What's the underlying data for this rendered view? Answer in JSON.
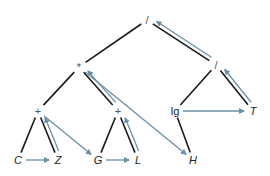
{
  "diagram": {
    "type": "expression-tree-traversal",
    "colors": {
      "edge": "#1a1a1a",
      "traversal": "#6b8fa3",
      "operator": "#555555",
      "leaf": "#222222"
    },
    "nodes": [
      {
        "id": "root",
        "label": "/",
        "x": 147,
        "y": 20,
        "italic": false,
        "op": true
      },
      {
        "id": "mul",
        "label": "*",
        "x": 79,
        "y": 67,
        "italic": false,
        "op": true
      },
      {
        "id": "div2",
        "label": "/",
        "x": 216,
        "y": 65,
        "italic": false,
        "op": true
      },
      {
        "id": "plus1",
        "label": "+",
        "x": 38,
        "y": 111,
        "italic": false,
        "op": true
      },
      {
        "id": "plus2",
        "label": "+",
        "x": 118,
        "y": 111,
        "italic": false,
        "op": true
      },
      {
        "id": "lg",
        "label": "lg",
        "x": 175,
        "y": 111,
        "italic": false,
        "op": false
      },
      {
        "id": "T",
        "label": "T",
        "x": 253,
        "y": 111,
        "italic": true,
        "op": false
      },
      {
        "id": "C",
        "label": "C",
        "x": 18,
        "y": 160,
        "italic": true,
        "op": false
      },
      {
        "id": "Z",
        "label": "Z",
        "x": 58,
        "y": 160,
        "italic": true,
        "op": false
      },
      {
        "id": "G",
        "label": "G",
        "x": 98,
        "y": 160,
        "italic": true,
        "op": false
      },
      {
        "id": "L",
        "label": "L",
        "x": 138,
        "y": 160,
        "italic": true,
        "op": false
      },
      {
        "id": "H",
        "label": "H",
        "x": 193,
        "y": 160,
        "italic": true,
        "op": false
      }
    ],
    "edges": [
      {
        "from": "root",
        "to": "mul"
      },
      {
        "from": "root",
        "to": "div2"
      },
      {
        "from": "mul",
        "to": "plus1"
      },
      {
        "from": "mul",
        "to": "plus2"
      },
      {
        "from": "div2",
        "to": "lg"
      },
      {
        "from": "div2",
        "to": "T"
      },
      {
        "from": "plus1",
        "to": "C"
      },
      {
        "from": "plus1",
        "to": "Z"
      },
      {
        "from": "plus2",
        "to": "G"
      },
      {
        "from": "plus2",
        "to": "L"
      },
      {
        "from": "lg",
        "to": "H"
      }
    ],
    "traversal_arrows": [
      {
        "from": "C",
        "to": "Z"
      },
      {
        "from": "Z",
        "to": "plus1"
      },
      {
        "from": "plus1",
        "to": "G"
      },
      {
        "from": "G",
        "to": "L"
      },
      {
        "from": "L",
        "to": "plus2"
      },
      {
        "from": "plus2",
        "to": "mul"
      },
      {
        "from": "mul",
        "to": "H"
      },
      {
        "from": "lg",
        "to": "T"
      },
      {
        "from": "T",
        "to": "div2"
      },
      {
        "from": "div2",
        "to": "root"
      }
    ]
  }
}
